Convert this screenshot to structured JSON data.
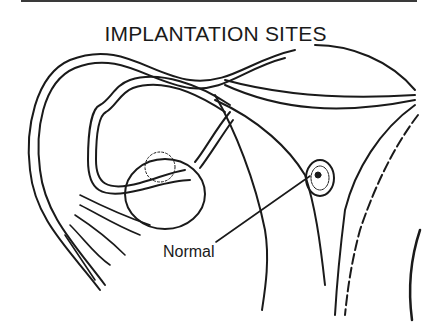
{
  "figure": {
    "title": "IMPLANTATION SITES",
    "labels": [
      {
        "text": "Normal",
        "points_to": "implantation site in uterine wall"
      }
    ],
    "structures": [
      "fallopian tube",
      "fimbriae",
      "ovary",
      "follicle",
      "uterine wall",
      "implanted embryo",
      "uterine cavity"
    ],
    "line_color": "#1a1a1a",
    "background": "#ffffff"
  }
}
